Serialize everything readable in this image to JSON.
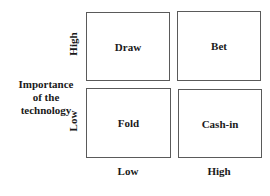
{
  "diagram": {
    "type": "2x2 matrix",
    "y_axis": {
      "title_lines": [
        "Importance",
        "of the",
        "technology"
      ],
      "high_label": "High",
      "low_label": "Low"
    },
    "x_axis": {
      "low_label": "Low",
      "high_label": "High"
    },
    "quadrants": {
      "top_left": "Draw",
      "top_right": "Bet",
      "bottom_left": "Fold",
      "bottom_right": "Cash-in"
    }
  }
}
